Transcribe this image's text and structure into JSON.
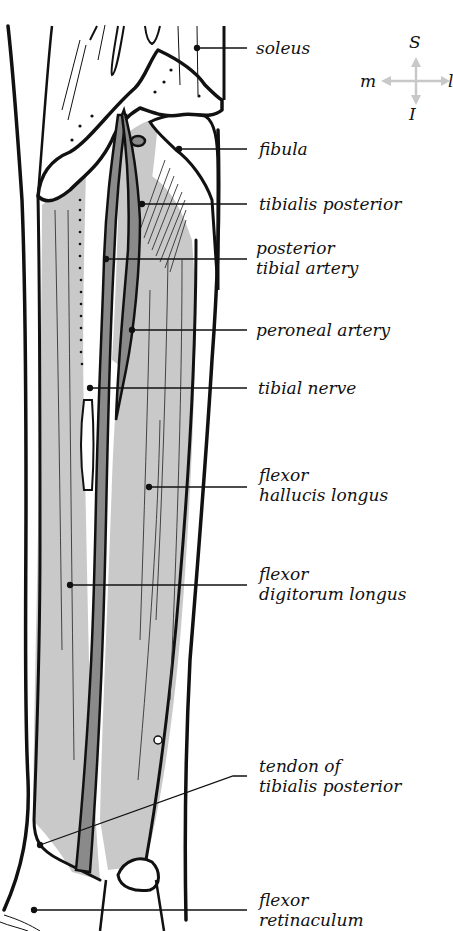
{
  "figure": {
    "type": "anatomical illustration"
  },
  "compass": {
    "superior": "S",
    "inferior": "I",
    "medial": "m",
    "lateral": "l",
    "arrow_color": "#c8c8c8"
  },
  "colors": {
    "outline": "#111111",
    "muscle_fill": "#c9c9c9",
    "artery_fill": "#8a8a8a",
    "bone_fill": "#ffffff",
    "background": "#ffffff"
  },
  "labels": [
    {
      "id": "soleus",
      "lines": [
        "soleus"
      ]
    },
    {
      "id": "fibula",
      "lines": [
        "fibula"
      ]
    },
    {
      "id": "tibialis-posterior",
      "lines": [
        "tibialis posterior"
      ]
    },
    {
      "id": "posterior-tibial-artery",
      "lines": [
        "posterior",
        "tibial artery"
      ]
    },
    {
      "id": "peroneal-artery",
      "lines": [
        "peroneal artery"
      ]
    },
    {
      "id": "tibial-nerve",
      "lines": [
        "tibial nerve"
      ]
    },
    {
      "id": "flexor-hallucis-longus",
      "lines": [
        "flexor",
        "hallucis longus"
      ]
    },
    {
      "id": "flexor-digitorum-longus",
      "lines": [
        "flexor",
        "digitorum longus"
      ]
    },
    {
      "id": "tendon-of-tibialis-posterior",
      "lines": [
        "tendon of",
        "tibialis posterior"
      ]
    },
    {
      "id": "flexor-retinaculum",
      "lines": [
        "flexor",
        "retinaculum"
      ]
    }
  ]
}
